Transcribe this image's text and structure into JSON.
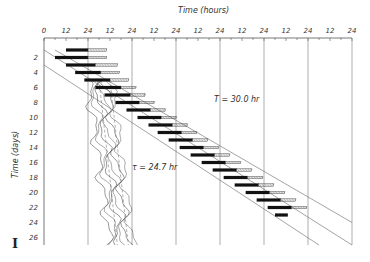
{
  "chart_data": {
    "type": "actogram",
    "title": "",
    "panel_label": "I",
    "xlabel": "Time (hours)",
    "ylabel": "Time (days)",
    "x_ticks": [
      "0",
      "12",
      "24",
      "12",
      "24",
      "12",
      "24",
      "12",
      "24",
      "12",
      "24",
      "12",
      "24",
      "12",
      "24"
    ],
    "y_ticks": [
      "2",
      "4",
      "6",
      "8",
      "10",
      "12",
      "14",
      "16",
      "18",
      "20",
      "22",
      "24",
      "26"
    ],
    "xlim": [
      0,
      168
    ],
    "ylim": [
      0,
      27
    ],
    "grid": "vertical lines every 24 h",
    "annotations": [
      {
        "text": "T = 30.0 hr",
        "position": "upper right, near day 7, hour ~120"
      },
      {
        "text": "τ = 24.7 hr",
        "position": "lower middle, near day 16, hour ~60"
      }
    ],
    "series": [
      {
        "name": "activity bars (entrained to T = 30.0 hr light cycle)",
        "style": "solid black bars followed by hatched tails",
        "days": [
          1,
          2,
          3,
          4,
          5,
          6,
          7,
          8,
          9,
          10,
          11,
          12,
          13,
          14,
          15,
          16,
          17,
          18,
          19,
          20,
          21,
          22,
          23
        ],
        "onset_hours": [
          12,
          6,
          12,
          17,
          22,
          28,
          33,
          39,
          45,
          51,
          57,
          62,
          68,
          74,
          80,
          86,
          92,
          98,
          104,
          110,
          116,
          122,
          126
        ],
        "solid_duration_hours": [
          12,
          18,
          16,
          14,
          14,
          14,
          14,
          13,
          13,
          13,
          13,
          13,
          13,
          13,
          13,
          13,
          13,
          13,
          13,
          13,
          13,
          13,
          7
        ],
        "hatched_duration_hours": [
          10,
          10,
          12,
          10,
          10,
          8,
          8,
          8,
          8,
          8,
          8,
          8,
          8,
          8,
          8,
          8,
          8,
          8,
          8,
          8,
          8,
          8,
          0
        ]
      },
      {
        "name": "light-dark boundary lines (T = 30.0 hr)",
        "style": "thin diagonal parallel lines",
        "lines": [
          {
            "start": [
              0,
              1
            ],
            "end": [
              168,
              27
            ]
          },
          {
            "start": [
              0,
              3
            ],
            "end": [
              150,
              27
            ]
          },
          {
            "start": [
              6,
              1
            ],
            "end": [
              168,
              24
            ]
          }
        ]
      },
      {
        "name": "free-running rhythm traces (τ = 24.7 hr)",
        "style": "multiple thin wavy lines, dashed guides",
        "start_day": 5,
        "end_day": 27,
        "hour_range_start": [
          24,
          36
        ],
        "hour_range_end": [
          36,
          48
        ]
      }
    ]
  },
  "labels": {
    "x_axis_title": "Time (hours)",
    "y_axis_title": "Time (days)",
    "annotation_T": "T = 30.0 hr",
    "annotation_tau": "τ = 24.7 hr",
    "panel": "I"
  }
}
